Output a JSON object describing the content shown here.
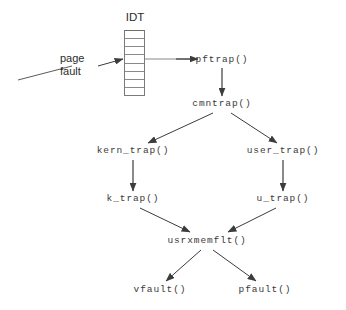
{
  "diagram": {
    "title_labels": {
      "idt": "IDT",
      "page_fault_line1": "page",
      "page_fault_line2": "fault"
    },
    "idt_table": {
      "row_count": 8,
      "selected_row_index": 2
    },
    "nodes": [
      {
        "id": "pftrap",
        "label": "pftrap()",
        "x": 222,
        "y": 60
      },
      {
        "id": "cmntrap",
        "label": "cmntrap()",
        "x": 222,
        "y": 104
      },
      {
        "id": "kern_trap",
        "label": "kern_trap()",
        "x": 133,
        "y": 151
      },
      {
        "id": "user_trap",
        "label": "user_trap()",
        "x": 283,
        "y": 151
      },
      {
        "id": "k_trap",
        "label": "k_trap()",
        "x": 133,
        "y": 199
      },
      {
        "id": "u_trap",
        "label": "u_trap()",
        "x": 283,
        "y": 199
      },
      {
        "id": "usrxmemflt",
        "label": "usrxmemflt()",
        "x": 207,
        "y": 241
      },
      {
        "id": "vfault",
        "label": "vfault()",
        "x": 160,
        "y": 290
      },
      {
        "id": "pfault",
        "label": "pfault()",
        "x": 265,
        "y": 290
      }
    ],
    "edges": [
      {
        "from": "page-fault",
        "to": "idt-table"
      },
      {
        "from": "idt-table",
        "to": "pftrap"
      },
      {
        "from": "pftrap",
        "to": "cmntrap"
      },
      {
        "from": "cmntrap",
        "to": "kern_trap"
      },
      {
        "from": "cmntrap",
        "to": "user_trap"
      },
      {
        "from": "kern_trap",
        "to": "k_trap"
      },
      {
        "from": "user_trap",
        "to": "u_trap"
      },
      {
        "from": "k_trap",
        "to": "usrxmemflt"
      },
      {
        "from": "u_trap",
        "to": "usrxmemflt"
      },
      {
        "from": "usrxmemflt",
        "to": "vfault"
      },
      {
        "from": "usrxmemflt",
        "to": "pfault"
      }
    ],
    "colors": {
      "background": "#ffffff",
      "stroke": "#3c3c3c",
      "table_stroke": "#7a7a7a",
      "text": "#3a3a3a",
      "sans_text": "#2b2b2b"
    }
  }
}
